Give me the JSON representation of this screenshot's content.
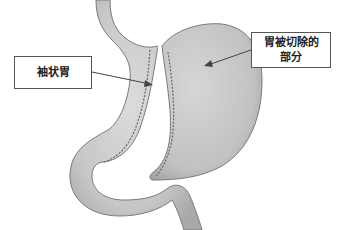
{
  "diagram": {
    "labels": {
      "sleeve_stomach": "袖状胃",
      "removed_part_line1": "胃被切除的",
      "removed_part_line2": "部分"
    },
    "colors": {
      "organ_fill": "#c8c8c8",
      "organ_stroke": "#7a7a7a",
      "staple_line": "#666666",
      "arrow": "#444444",
      "background": "#ffffff"
    }
  }
}
